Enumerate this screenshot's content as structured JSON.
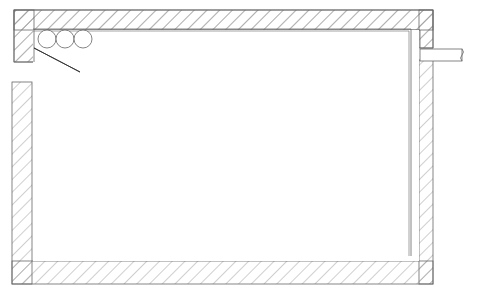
{
  "diagram": {
    "colors": {
      "line": "#555555",
      "hatch": "#888888",
      "text": "#222222",
      "background": "#ffffff"
    },
    "labels": {
      "distribution_facilities": "Distribution Facilities\nTrade Size 4\nSleeve Minimum (Firestopped)",
      "ceiling_ladder_top": "Ceiling Level\nLadder Rack",
      "plywood_top": "Trade Size 3/4\nPlywood\nBackboard",
      "closet_conduit": "Closet\nInterconnecting\nConduit\nTrade Size 3\nMinimum\n(Firestopped)",
      "fixture_left": "Ceiling\nFluorescent\nFixture",
      "fixture_right": "Ceiling\nFluorescent\nFixture",
      "fixture_center": "Ceiling\nFluorescent\nFixture",
      "ceiling_ladder_right": "Ceiling\nLevel\nLadder\nRack",
      "rack_left": "Equipment\nRack",
      "rack_right": "Equipment\nRack",
      "plywood_right": "Trade Size 3/4\nPlywood\nBackboard",
      "rear_left": "Rear",
      "rear_right": "Rear",
      "front_left": "Front",
      "front_right": "Front",
      "aisle": "1 m (3.3 ft Plus) Aisle\n(Eqpt. Repair & Install)",
      "access_left": "Access to\nPower and\nGround",
      "access_right": "Access to\nPower and\nGround",
      "equip_power_left": "Equipment\nPower",
      "instrument_power": "Instrument\nPower",
      "equip_power_right": "Equipment\nPower",
      "ladder_rack_bottom": "Ladder Rack (Above Equipment Racks)"
    }
  }
}
